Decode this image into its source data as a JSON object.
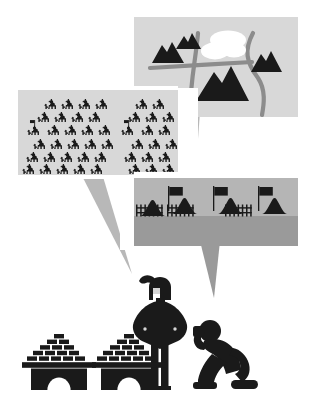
{
  "illustration": {
    "title": "Military Commander Intelligence Briefing",
    "background_color": "#ffffff",
    "palette": {
      "ink": "#1a1a1a",
      "panel_light": "#d8d8d8",
      "panel_mid": "#b5b5b5",
      "panel_dark": "#9a9a9a",
      "tail_gray": "#b8b8b8",
      "road_gray": "#8c8c8c",
      "water_white": "#ffffff",
      "ground_gray": "#a8a8a8"
    }
  },
  "panels": [
    {
      "id": "map-panel",
      "name": "terrain-map-panel",
      "label": "Terrain reconnaissance map",
      "x": 134,
      "y": 17,
      "width": 164,
      "height": 100,
      "fill": "#d8d8d8",
      "tail": {
        "tip_x": 196,
        "tip_y": 166,
        "base_left_x": 182,
        "base_right_x": 200
      },
      "contents": {
        "mountains": [
          {
            "name": "mountain-small-north",
            "cx": 186,
            "cy": 42,
            "w": 22,
            "h": 15
          },
          {
            "name": "mountain-west",
            "cx": 167,
            "cy": 54,
            "w": 30,
            "h": 19
          },
          {
            "name": "mountain-east",
            "cx": 266,
            "cy": 62,
            "w": 28,
            "h": 18
          },
          {
            "name": "mountain-large-center",
            "cx": 222,
            "cy": 85,
            "w": 52,
            "h": 32
          }
        ],
        "lake": {
          "name": "lake-shape",
          "cx": 224,
          "cy": 47,
          "rx": 24,
          "ry": 12
        },
        "roads": [
          {
            "name": "road-horizontal",
            "from": [
              152,
              67
            ],
            "to": [
              250,
              63
            ]
          },
          {
            "name": "road-vertical-curve",
            "from": [
              197,
              34
            ],
            "to": [
              192,
              112
            ]
          },
          {
            "name": "road-east-curve",
            "from": [
              254,
              33
            ],
            "to": [
              262,
              115
            ]
          }
        ]
      }
    },
    {
      "id": "cavalry-panel",
      "name": "cavalry-forces-panel",
      "label": "Cavalry force strength report",
      "x": 18,
      "y": 90,
      "width": 160,
      "height": 85,
      "fill": "#d8d8d8",
      "tail": {
        "tip_x": 132,
        "tip_y": 274,
        "base_left_x": 79,
        "base_right_x": 101
      },
      "contents": {
        "rider_count": 44,
        "standard_bearer_count": 2,
        "rider_icon": "horse-rider-icon",
        "standard_icon": "cavalry-standard-icon",
        "rows": 5,
        "formation_note": "two squadrons separated by a gap"
      }
    },
    {
      "id": "camp-panel",
      "name": "enemy-camp-panel",
      "label": "Enemy encampment report",
      "x": 134,
      "y": 178,
      "width": 164,
      "height": 68,
      "fill": "#b5b5b5",
      "tail": {
        "tip_x": 214,
        "tip_y": 298,
        "base_left_x": 200,
        "base_right_x": 220
      },
      "contents": {
        "tent_count": 4,
        "flag_count": 3,
        "palisade_sections": 3,
        "ground_fill": "#9a9a9a",
        "tent_icon": "tent-icon",
        "flag_icon": "camp-flag-icon",
        "fence_icon": "palisade-fence-icon"
      }
    }
  ],
  "figures": [
    {
      "id": "commander",
      "name": "commander-figure",
      "label": "Commander with plumed helmet",
      "x": 132,
      "y": 274,
      "width": 56,
      "height": 115,
      "icon": "commander-icon",
      "details": {
        "helmet": "plumed-helmet-icon",
        "plume": "helmet-plume",
        "cloak": "commander-cloak"
      }
    },
    {
      "id": "messenger",
      "name": "kneeling-messenger-figure",
      "label": "Kneeling messenger delivering report",
      "x": 190,
      "y": 318,
      "width": 68,
      "height": 72,
      "icon": "kneeling-person-icon"
    }
  ],
  "structures": [
    {
      "id": "fort-left",
      "name": "brick-fortification-left",
      "label": "Brick fortification with arch",
      "x": 27,
      "y": 334,
      "width": 62,
      "height": 56,
      "icon": "brick-arch-icon",
      "brick_rows": 5,
      "arch": "arched-gateway"
    },
    {
      "id": "fort-right",
      "name": "brick-fortification-right",
      "label": "Brick fortification with arch",
      "x": 97,
      "y": 334,
      "width": 62,
      "height": 56,
      "icon": "brick-arch-icon",
      "brick_rows": 5,
      "arch": "arched-gateway"
    }
  ],
  "accessibility": {
    "alt_text": "Flat illustration: a helmeted commander stands between two brick fortifications while a kneeling messenger reports. Three gray speech panels above show a terrain map with mountains, a lake and roads; a large cavalry formation with standard bearers; and an enemy camp of tents behind a palisade with flags."
  }
}
